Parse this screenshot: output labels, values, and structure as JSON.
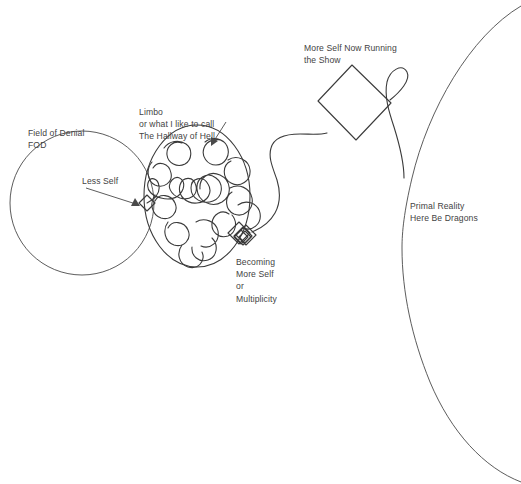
{
  "diagram": {
    "title_present": false,
    "background_color": "#ffffff",
    "line_color": "#3b3b3b",
    "text_color": "#434343",
    "labels": {
      "field_of_denial": "Field of Denial\nFOD",
      "limbo": "Limbo\nor what I like to call\nThe Hallway of Hell",
      "less_self": "Less Self",
      "becoming": "Becoming\nMore Self\nor\nMultiplicity",
      "more_self_now": "More Self Now Running\nthe Show",
      "primal_reality": "Primal Reality\nHere Be Dragons"
    },
    "shapes": [
      {
        "name": "field-of-denial-circle",
        "type": "circle",
        "label": "Field of Denial FOD",
        "cx": 82,
        "cy": 203,
        "r": 72
      },
      {
        "name": "limbo-oval",
        "type": "ellipse",
        "label": "Limbo / The Hallway of Hell",
        "cx": 197,
        "cy": 196,
        "rx": 53,
        "ry": 71
      },
      {
        "name": "less-self-diamond",
        "type": "diamond",
        "label": "Less Self",
        "cx": 147,
        "cy": 203,
        "size": 11
      },
      {
        "name": "becoming-more-self-diamond-cluster",
        "type": "diamond-cluster",
        "label": "Becoming More Self or Multiplicity",
        "cx": 244,
        "cy": 234,
        "count": 5
      },
      {
        "name": "more-self-now-running-square",
        "type": "rotated-square",
        "label": "More Self Now Running the Show",
        "cx": 354,
        "cy": 102,
        "half": 38,
        "rotation_deg": 42
      },
      {
        "name": "primal-reality-circle",
        "type": "large-circle-arc",
        "label": "Primal Reality Here Be Dragons",
        "cx": 660,
        "cy": 240,
        "r": 260
      }
    ],
    "connectors": [
      {
        "name": "less-self-pointer-arrow",
        "from": "less-self-label",
        "to": "less-self-diamond",
        "style": "straight-arrow"
      },
      {
        "name": "limbo-pointer-arrow",
        "from": "limbo-label",
        "to": "limbo-oval",
        "style": "straight-arrow"
      },
      {
        "name": "limbo-scribble-path",
        "from": "less-self-diamond",
        "to": "becoming-more-self-diamond-cluster",
        "style": "maze-scribble"
      },
      {
        "name": "becoming-to-square-path",
        "from": "becoming-more-self-diamond-cluster",
        "to": "more-self-now-running-square",
        "style": "wavy-curve"
      },
      {
        "name": "square-to-primal-reality-path",
        "from": "more-self-now-running-square",
        "to": "primal-reality-circle",
        "style": "loop-curve"
      }
    ]
  }
}
